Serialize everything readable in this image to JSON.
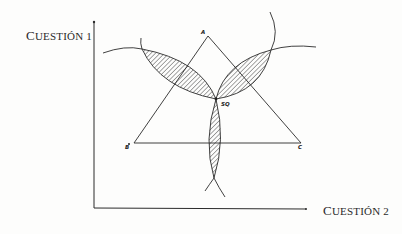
{
  "axes": {
    "y_label_initial": "C",
    "y_label_rest": "UESTIÓN 1",
    "x_label_initial": "C",
    "x_label_rest": "UESTIÓN 2"
  },
  "points": {
    "a": "A",
    "b": "B",
    "c": "C",
    "sq": "SQ"
  },
  "colors": {
    "line": "#2b2b2b",
    "hatch": "#3a3a3a",
    "background": "#fdfdfc"
  }
}
